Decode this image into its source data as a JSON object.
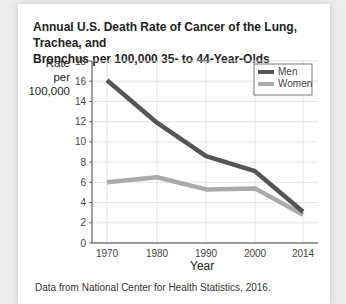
{
  "chart_data": {
    "type": "line",
    "title": "Annual U.S. Death Rate of Cancer of the Lung, Trachea, and Bronchus per 100,000 35- to 44-Year-Olds",
    "xlabel": "Year",
    "ylabel": "Rate per 100,000",
    "categories": [
      "1970",
      "1980",
      "1990",
      "2000",
      "2014"
    ],
    "series": [
      {
        "name": "Men",
        "color": "#555555",
        "values": [
          16.1,
          11.9,
          8.6,
          7.1,
          3.1
        ]
      },
      {
        "name": "Women",
        "color": "#aaaaaa",
        "values": [
          6.0,
          6.5,
          5.3,
          5.4,
          2.8
        ]
      }
    ],
    "ylim": [
      0,
      18
    ],
    "yticks": [
      "0",
      "2",
      "4",
      "6",
      "8",
      "10",
      "12",
      "14",
      "16",
      "18"
    ],
    "grid": true,
    "legend_position": "top-right",
    "source": "Data from National Center for Health Statistics, 2016."
  },
  "header": {
    "title": "Annual U.S. Death Rate of Cancer of the Lung, Trachea, and\nBronchus per 100,000 35- to 44-Year-Olds"
  },
  "axis": {
    "ylabel": "Rate per\n100,000",
    "xlabel": "Year"
  },
  "legend": {
    "men": "Men",
    "women": "Women"
  },
  "footer": {
    "source": "Data from National Center for Health Statistics, 2016."
  }
}
